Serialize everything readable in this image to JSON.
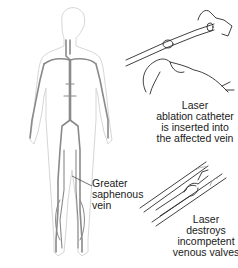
{
  "figure": {
    "panels": [
      {
        "name": "body-venous-anatomy"
      },
      {
        "name": "catheter-insertion"
      },
      {
        "name": "laser-in-vein"
      }
    ],
    "labels": {
      "greater_saphenous_vein": {
        "line1": "Greater",
        "line2": "saphenous",
        "line3": "vein"
      },
      "catheter_insertion": {
        "line1": "Laser",
        "line2": "ablation catheter",
        "line3": "is inserted into",
        "line4": "the affected vein"
      },
      "laser_destroys": {
        "line1": "Laser",
        "line2": "destroys",
        "line3": "incompetent",
        "line4": "venous valves"
      }
    },
    "colors": {
      "body_outline": "#d6d6d6",
      "veins": "#8a8a8a",
      "line_art": "#2a2a2a",
      "text": "#1a1a1a"
    }
  }
}
